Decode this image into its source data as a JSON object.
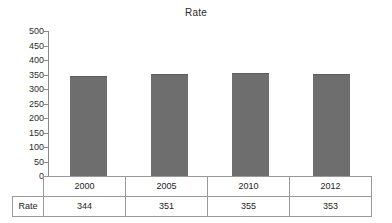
{
  "chart_data": {
    "type": "bar",
    "title": "Rate",
    "xlabel": "",
    "ylabel": "",
    "categories": [
      "2000",
      "2005",
      "2010",
      "2012"
    ],
    "values": [
      344,
      351,
      355,
      353
    ],
    "series": [
      {
        "name": "Rate",
        "values": [
          344,
          351,
          355,
          353
        ]
      }
    ],
    "ylim": [
      0,
      500
    ],
    "ytick_step": 50,
    "yticks": [
      "500",
      "450",
      "400",
      "350",
      "300",
      "250",
      "200",
      "150",
      "100",
      "50",
      "0"
    ],
    "grid": false,
    "legend": false,
    "bar_color": "#6e6e6e",
    "axis_color": "#8a8a8a"
  },
  "table": {
    "row_label": "Rate",
    "header": [
      "2000",
      "2005",
      "2010",
      "2012"
    ],
    "values": [
      "344",
      "351",
      "355",
      "353"
    ]
  }
}
